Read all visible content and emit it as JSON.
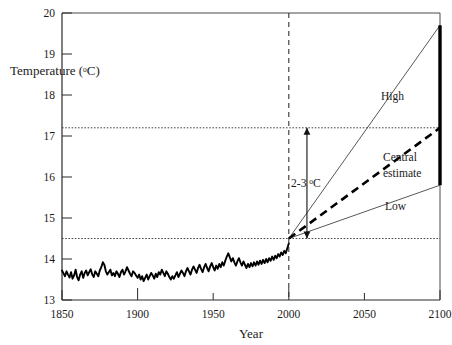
{
  "chart_data": {
    "type": "line",
    "title": "",
    "xlabel": "Year",
    "ylabel": "Temperature (ºC)",
    "ylabel_main": "Temperature (",
    "ylabel_unit_o": "o",
    "ylabel_unit_c": "C)",
    "xlim": [
      1850,
      2100
    ],
    "ylim": [
      13,
      20
    ],
    "grid": "dotted horizontal reference lines at 14.5 and 17.2",
    "legend_position": "inline labels beside each projection line",
    "xticks": [
      1850,
      1900,
      1950,
      2000,
      2050,
      2100
    ],
    "xtick_labels": [
      "1850",
      "1900",
      "1950",
      "2000",
      "2050",
      "2100"
    ],
    "yticks": [
      13,
      14,
      15,
      16,
      17,
      18,
      19,
      20
    ],
    "ytick_labels": [
      "13",
      "14",
      "15",
      "16",
      "17",
      "18",
      "19",
      "20"
    ],
    "reference_lines": {
      "horizontal": [
        {
          "value": 14.5,
          "style": "dotted",
          "note": "year-2000 baseline temperature"
        },
        {
          "value": 17.2,
          "style": "dotted",
          "note": "upper bound of central projection"
        }
      ],
      "vertical": [
        {
          "value": 2000,
          "style": "dashed",
          "note": "present day / start of projections"
        }
      ]
    },
    "annotations": [
      {
        "text": "2-3 ºC",
        "text_main": "2-3 ",
        "text_unit_o": "o",
        "text_unit_c": "C",
        "x": 2012,
        "y_from": 14.5,
        "y_to": 17.2,
        "style": "double-headed vertical arrow",
        "note": "projected warming range by 2100"
      }
    ],
    "series": [
      {
        "name": "Observed",
        "label": "",
        "style": "solid thick black",
        "x_start": 1850,
        "x_end": 2000,
        "values": [
          13.72,
          13.65,
          13.58,
          13.7,
          13.62,
          13.55,
          13.68,
          13.52,
          13.6,
          13.74,
          13.56,
          13.48,
          13.62,
          13.7,
          13.54,
          13.66,
          13.72,
          13.6,
          13.68,
          13.75,
          13.62,
          13.56,
          13.7,
          13.64,
          13.58,
          13.72,
          13.8,
          13.92,
          13.86,
          13.7,
          13.62,
          13.68,
          13.74,
          13.6,
          13.66,
          13.58,
          13.7,
          13.64,
          13.56,
          13.68,
          13.74,
          13.62,
          13.7,
          13.8,
          13.72,
          13.64,
          13.58,
          13.7,
          13.66,
          13.6,
          13.54,
          13.62,
          13.5,
          13.58,
          13.46,
          13.54,
          13.62,
          13.5,
          13.58,
          13.66,
          13.6,
          13.52,
          13.64,
          13.56,
          13.68,
          13.62,
          13.74,
          13.66,
          13.58,
          13.7,
          13.64,
          13.56,
          13.5,
          13.58,
          13.52,
          13.6,
          13.68,
          13.56,
          13.64,
          13.72,
          13.66,
          13.58,
          13.7,
          13.78,
          13.7,
          13.62,
          13.74,
          13.82,
          13.74,
          13.66,
          13.78,
          13.86,
          13.76,
          13.68,
          13.8,
          13.88,
          13.78,
          13.7,
          13.82,
          13.9,
          13.8,
          13.72,
          13.84,
          13.76,
          13.88,
          13.8,
          13.92,
          13.84,
          13.96,
          14.06,
          14.14,
          14.04,
          13.94,
          14.02,
          13.92,
          13.84,
          13.94,
          14.02,
          13.92,
          13.84,
          13.94,
          13.86,
          13.78,
          13.88,
          13.8,
          13.9,
          13.82,
          13.92,
          13.84,
          13.94,
          13.86,
          13.96,
          13.88,
          13.98,
          13.9,
          14.0,
          13.92,
          14.02,
          13.96,
          14.06,
          13.98,
          14.08,
          14.02,
          14.12,
          14.06,
          14.16,
          14.1,
          14.2,
          14.14,
          14.26,
          14.38
        ]
      },
      {
        "name": "High",
        "label": "High",
        "style": "thin solid",
        "points": [
          [
            2000,
            14.5
          ],
          [
            2100,
            19.7
          ]
        ]
      },
      {
        "name": "Central estimate",
        "label": "Central estimate",
        "label_line1": "Central",
        "label_line2": "estimate",
        "style": "thick dashed",
        "points": [
          [
            2000,
            14.5
          ],
          [
            2100,
            17.2
          ]
        ]
      },
      {
        "name": "Low",
        "label": "Low",
        "style": "thin solid",
        "points": [
          [
            2000,
            14.5
          ],
          [
            2100,
            15.8
          ]
        ]
      }
    ],
    "range_bar": {
      "x": 2100,
      "y_from": 15.8,
      "y_to": 19.7,
      "style": "thick solid vertical bar",
      "note": "spread of 2100 projections"
    }
  }
}
